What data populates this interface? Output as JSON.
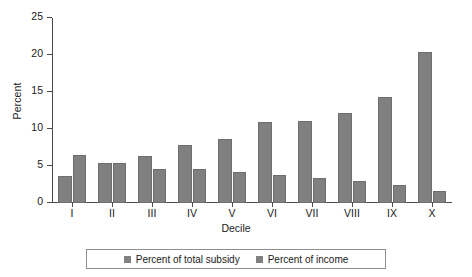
{
  "chart_data": {
    "type": "bar",
    "title": "",
    "subtitle": "",
    "xlabel": "Decile",
    "ylabel": "Percent",
    "categories": [
      "I",
      "II",
      "III",
      "IV",
      "V",
      "VI",
      "VII",
      "VIII",
      "IX",
      "X"
    ],
    "series": [
      {
        "name": "Percent of total subsidy",
        "color": "#808080",
        "values": [
          3.7,
          5.4,
          6.3,
          7.8,
          8.6,
          11.0,
          11.1,
          12.2,
          14.3,
          20.4
        ]
      },
      {
        "name": "Percent of income",
        "color": "#808080",
        "values": [
          6.5,
          5.4,
          4.6,
          4.6,
          4.2,
          3.8,
          3.4,
          3.0,
          2.4,
          1.6
        ]
      }
    ],
    "ylim": [
      0,
      25
    ],
    "yticks": [
      0,
      5,
      10,
      15,
      20,
      25
    ],
    "ytick_labels": [
      "0",
      "5",
      "10",
      "15",
      "20",
      "25"
    ],
    "grid": false,
    "legend_position": "bottom"
  },
  "legend": {
    "entries": [
      {
        "label": "Percent of total subsidy"
      },
      {
        "label": "Percent of income"
      }
    ]
  },
  "axes": {
    "y_title": "Percent",
    "x_title": "Decile"
  }
}
